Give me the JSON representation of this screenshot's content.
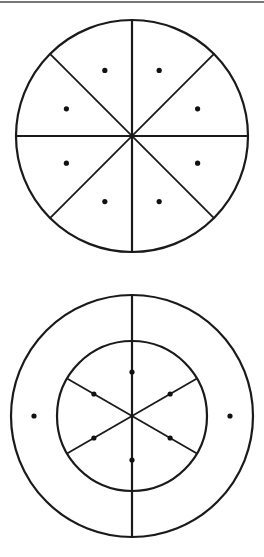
{
  "page": {
    "width": 264,
    "height": 557,
    "background_color": "#ffffff",
    "ink_color": "#1a1a1a",
    "dot_color": "#111111",
    "rule_color": "#4a4a4a"
  },
  "top_rule": {
    "name": "horizontal rule",
    "x1": 0,
    "y1": 2,
    "x2": 264,
    "y2": 2,
    "stroke_width": 1.4
  },
  "figures": [
    {
      "id": "figure-1",
      "label": "circle divided into eight equal sectors",
      "center_x": 132,
      "center_y": 136,
      "outer_radius": 116,
      "stroke_width": 2.2,
      "sector_count": 8,
      "divider_angles_deg": [
        0,
        45,
        90,
        135
      ],
      "dot_count": 8,
      "dot_radius": 2.6,
      "dot_ring_radius": 71,
      "dot_angles_deg": [
        22.5,
        67.5,
        112.5,
        157.5,
        202.5,
        247.5,
        292.5,
        337.5
      ]
    },
    {
      "id": "figure-2",
      "label": "annulus with inner circle divided into six equal sectors",
      "center_x": 132,
      "center_y": 416,
      "outer_radius": 121,
      "inner_radius": 75,
      "stroke_width": 2.2,
      "inner_sector_count": 6,
      "inner_divider_angles_deg": [
        30,
        90,
        150
      ],
      "vertical_line_full_diameter": true,
      "inner_dot_count": 6,
      "inner_dot_radius": 2.6,
      "inner_dot_ring_radius": 44,
      "inner_dot_angles_deg": [
        30,
        90,
        150,
        210,
        270,
        330
      ],
      "ring_dot_count": 2,
      "ring_dot_radius": 2.6,
      "ring_dot_ring_radius": 98,
      "ring_dot_angles_deg": [
        0,
        180
      ]
    }
  ]
}
